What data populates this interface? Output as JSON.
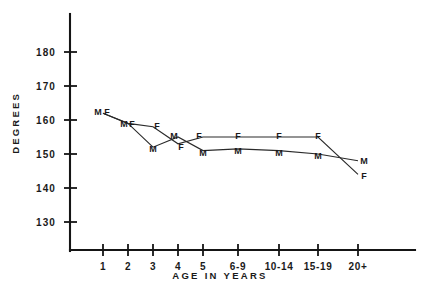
{
  "chart_data": {
    "type": "line",
    "title": "",
    "xlabel": "AGE IN YEARS",
    "ylabel": "DEGREES",
    "categories": [
      "1",
      "2",
      "3",
      "4",
      "5",
      "6-9",
      "10-14",
      "15-19",
      "20+"
    ],
    "yticks": [
      180,
      170,
      160,
      150,
      140,
      130
    ],
    "ylim": [
      125,
      185
    ],
    "grid": false,
    "legend": null,
    "point_marker_labels": true,
    "series": [
      {
        "name": "M",
        "label": "M",
        "values": [
          162,
          159,
          152,
          155,
          151,
          151.5,
          151,
          150,
          148
        ]
      },
      {
        "name": "F",
        "label": "F",
        "values": [
          162,
          159,
          158,
          153,
          155,
          155,
          155,
          155,
          144
        ]
      }
    ],
    "point_labels": {
      "M": [
        "M",
        "M",
        "M",
        "M",
        "M",
        "M",
        "M",
        "M",
        "M"
      ],
      "F": [
        "F",
        "F",
        "F",
        "F",
        "F",
        "F",
        "F",
        "F",
        "F"
      ]
    }
  },
  "axis": {
    "y_title": "DEGREES",
    "x_title": "AGE IN YEARS",
    "y_labels": [
      "180",
      "170",
      "160",
      "150",
      "140",
      "130"
    ],
    "x_labels": [
      "1",
      "2",
      "3",
      "4",
      "5",
      "6-9",
      "10-14",
      "15-19",
      "20+"
    ]
  },
  "colors": {
    "ink": "#151515",
    "line": "#2a2a2a",
    "background": "#ffffff"
  }
}
